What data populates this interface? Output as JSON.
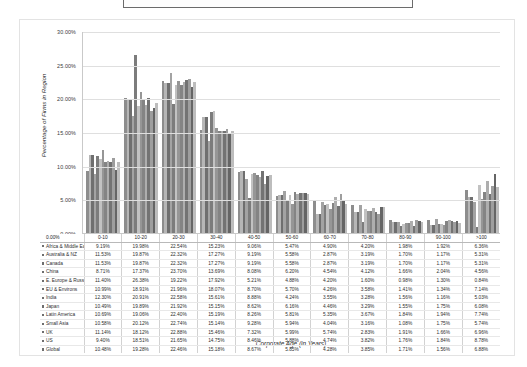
{
  "window": {
    "top_banner_text": "Percentage of Firms in Region by Corporate Age"
  },
  "chart_data": {
    "type": "bar",
    "title": "",
    "xlabel": "Corporate Age (in Years)",
    "ylabel": "Percentage of Firms in Region",
    "ylim": [
      0,
      30
    ],
    "ytick_labels": [
      "30.00%",
      "25.00%",
      "20.00%",
      "15.00%",
      "10.00%",
      "5.00%",
      "0.00%"
    ],
    "ytick_values": [
      30,
      25,
      20,
      15,
      10,
      5,
      0
    ],
    "grid": true,
    "legend_position": "data-table",
    "categories": [
      "0-10",
      "10-20",
      "20-30",
      "30-40",
      "40-50",
      "50-60",
      "60-70",
      "70-80",
      "80-90",
      "90-100",
      ">100"
    ],
    "series": [
      {
        "name": "Africa & Middle East",
        "values": [
          9.19,
          19.98,
          22.54,
          15.23,
          9.06,
          5.47,
          4.9,
          4.2,
          1.98,
          1.92,
          6.36
        ]
      },
      {
        "name": "Australia & NZ",
        "values": [
          11.53,
          19.87,
          22.32,
          17.27,
          9.19,
          5.58,
          2.87,
          3.19,
          1.7,
          1.17,
          5.31
        ]
      },
      {
        "name": "Canada",
        "values": [
          11.53,
          19.87,
          22.32,
          17.27,
          9.19,
          5.58,
          2.87,
          3.19,
          1.7,
          1.17,
          5.31
        ]
      },
      {
        "name": "China",
        "values": [
          8.71,
          17.37,
          23.7,
          13.69,
          8.08,
          6.2,
          4.54,
          4.12,
          1.66,
          2.04,
          4.56
        ]
      },
      {
        "name": "E. Europe & Russia",
        "values": [
          11.4,
          26.38,
          19.22,
          17.92,
          5.21,
          4.88,
          4.2,
          1.6,
          0.98,
          1.3,
          0.84
        ]
      },
      {
        "name": "EU & Environs",
        "values": [
          10.99,
          18.91,
          21.96,
          18.07,
          8.7,
          5.7,
          4.26,
          3.58,
          1.41,
          1.34,
          7.14
        ]
      },
      {
        "name": "India",
        "values": [
          12.3,
          20.91,
          22.58,
          15.61,
          8.88,
          4.24,
          3.55,
          3.28,
          1.56,
          1.16,
          5.03
        ]
      },
      {
        "name": "Japan",
        "values": [
          10.49,
          19.89,
          21.92,
          15.15,
          8.62,
          6.16,
          4.46,
          3.29,
          1.55,
          1.75,
          6.08
        ]
      },
      {
        "name": "Latin America",
        "values": [
          10.69,
          19.06,
          22.4,
          15.19,
          8.26,
          5.81,
          5.35,
          3.67,
          1.84,
          1.94,
          7.74
        ]
      },
      {
        "name": "Small Asia",
        "values": [
          10.58,
          20.12,
          22.74,
          15.14,
          9.28,
          5.94,
          4.04,
          3.16,
          1.08,
          1.75,
          5.74
        ]
      },
      {
        "name": "UK",
        "values": [
          11.14,
          18.12,
          22.88,
          15.46,
          7.32,
          5.99,
          5.74,
          2.83,
          1.91,
          1.66,
          6.96
        ]
      },
      {
        "name": "US",
        "values": [
          9.4,
          18.51,
          21.65,
          14.75,
          8.46,
          5.88,
          4.74,
          3.82,
          1.76,
          1.84,
          8.78
        ]
      },
      {
        "name": "Global",
        "values": [
          10.48,
          19.28,
          22.46,
          15.18,
          8.67,
          5.85,
          4.28,
          3.85,
          1.71,
          1.56,
          6.88
        ]
      }
    ]
  },
  "table": {
    "corner_label": "0.00%",
    "columns": [
      "0-10",
      "10-20",
      "20-30",
      "30-40",
      "40-50",
      "50-60",
      "60-70",
      "70-80",
      "80-90",
      "90-100",
      ">100"
    ],
    "rows": [
      {
        "label": "Africa & Middle East",
        "cells": [
          "9.19%",
          "19.98%",
          "22.54%",
          "15.23%",
          "9.06%",
          "5.47%",
          "4.90%",
          "4.20%",
          "1.98%",
          "1.92%",
          "6.36%"
        ]
      },
      {
        "label": "Australia & NZ",
        "cells": [
          "11.53%",
          "19.87%",
          "22.32%",
          "17.27%",
          "9.19%",
          "5.58%",
          "2.87%",
          "3.19%",
          "1.70%",
          "1.17%",
          "5.31%"
        ]
      },
      {
        "label": "Canada",
        "cells": [
          "11.53%",
          "19.87%",
          "22.32%",
          "17.27%",
          "9.19%",
          "5.58%",
          "2.87%",
          "3.19%",
          "1.70%",
          "1.17%",
          "5.31%"
        ]
      },
      {
        "label": "China",
        "cells": [
          "8.71%",
          "17.37%",
          "23.70%",
          "13.69%",
          "8.08%",
          "6.20%",
          "4.54%",
          "4.12%",
          "1.66%",
          "2.04%",
          "4.56%"
        ]
      },
      {
        "label": "E. Europe & Russia",
        "cells": [
          "11.40%",
          "26.38%",
          "19.22%",
          "17.92%",
          "5.21%",
          "4.88%",
          "4.20%",
          "1.60%",
          "0.98%",
          "1.30%",
          "0.84%"
        ]
      },
      {
        "label": "EU & Environs",
        "cells": [
          "10.99%",
          "18.91%",
          "21.96%",
          "18.07%",
          "8.70%",
          "5.70%",
          "4.26%",
          "3.58%",
          "1.41%",
          "1.34%",
          "7.14%"
        ]
      },
      {
        "label": "India",
        "cells": [
          "12.30%",
          "20.91%",
          "22.58%",
          "15.61%",
          "8.88%",
          "4.24%",
          "3.55%",
          "3.28%",
          "1.56%",
          "1.16%",
          "5.03%"
        ]
      },
      {
        "label": "Japan",
        "cells": [
          "10.49%",
          "19.89%",
          "21.92%",
          "15.15%",
          "8.62%",
          "6.16%",
          "4.46%",
          "3.29%",
          "1.55%",
          "1.75%",
          "6.08%"
        ]
      },
      {
        "label": "Latin America",
        "cells": [
          "10.69%",
          "19.06%",
          "22.40%",
          "15.19%",
          "8.26%",
          "5.81%",
          "5.35%",
          "3.67%",
          "1.84%",
          "1.94%",
          "7.74%"
        ]
      },
      {
        "label": "Small Asia",
        "cells": [
          "10.58%",
          "20.12%",
          "22.74%",
          "15.14%",
          "9.28%",
          "5.94%",
          "4.04%",
          "3.16%",
          "1.08%",
          "1.75%",
          "5.74%"
        ]
      },
      {
        "label": "UK",
        "cells": [
          "11.14%",
          "18.12%",
          "22.88%",
          "15.46%",
          "7.32%",
          "5.99%",
          "5.74%",
          "2.83%",
          "1.91%",
          "1.66%",
          "6.96%"
        ]
      },
      {
        "label": "US",
        "cells": [
          "9.40%",
          "18.51%",
          "21.65%",
          "14.75%",
          "8.46%",
          "5.88%",
          "4.74%",
          "3.82%",
          "1.76%",
          "1.84%",
          "8.78%"
        ]
      },
      {
        "label": "Global",
        "cells": [
          "10.48%",
          "19.28%",
          "22.46%",
          "15.18%",
          "8.67%",
          "5.85%",
          "4.28%",
          "3.85%",
          "1.71%",
          "1.56%",
          "6.88%"
        ]
      }
    ]
  }
}
